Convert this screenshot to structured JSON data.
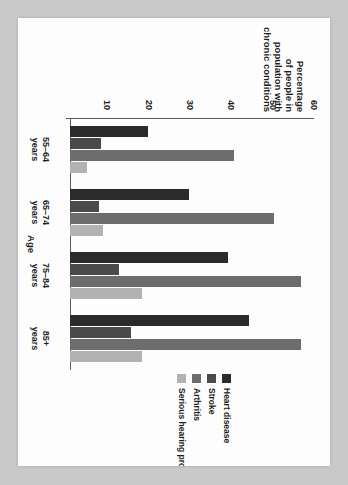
{
  "chart_data": {
    "type": "bar",
    "title": "",
    "xlabel": "Age",
    "ylabel": "Percentage of people in population with chronic conditions",
    "ylabel_lines": [
      "Percentage",
      "of people in",
      "population with",
      "chronic conditions"
    ],
    "categories": [
      "55–64\nyears",
      "65–74\nyears",
      "75–84\nyears",
      "85+\nyears"
    ],
    "category_lines": [
      [
        "55–64",
        "years"
      ],
      [
        "65–74",
        "years"
      ],
      [
        "75–84",
        "years"
      ],
      [
        "85+",
        "years"
      ]
    ],
    "ylim": [
      0,
      60
    ],
    "yticks": [
      10,
      20,
      30,
      40,
      50,
      60
    ],
    "ytick_labels": [
      "10",
      "20",
      "30",
      "40",
      "50",
      "60"
    ],
    "grid": false,
    "legend_position": "right",
    "orientation": "rotated-90",
    "series": [
      {
        "name": "Heart disease",
        "color": "#2b2b2b",
        "values": [
          18.8,
          28.8,
          38.2,
          43.3
        ]
      },
      {
        "name": "Stroke",
        "color": "#4a4a4a",
        "values": [
          7.6,
          7.0,
          11.8,
          14.8
        ]
      },
      {
        "name": "Arthritis",
        "color": "#6d6d6d",
        "values": [
          39.7,
          49.4,
          55.8,
          56.0
        ]
      },
      {
        "name": "Serious hearing problem",
        "color": "#b2b2b2",
        "values": [
          4.2,
          7.9,
          17.5,
          17.5
        ]
      }
    ]
  },
  "page": {
    "background": "#c9c9c9",
    "paper_background": "#fdfdfd"
  }
}
